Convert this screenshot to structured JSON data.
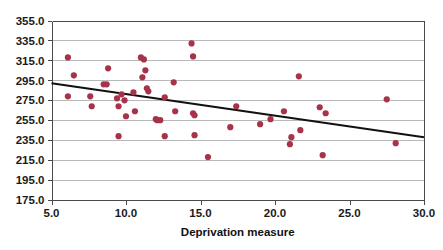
{
  "chart_data": {
    "type": "scatter",
    "title": "",
    "xlabel": "Deprivation measure",
    "ylabel": "",
    "xlim": [
      5.0,
      30.0
    ],
    "ylim": [
      175.0,
      355.0
    ],
    "grid": true,
    "legend": null,
    "xticks": [
      "5.0",
      "10.0",
      "15.0",
      "20.0",
      "25.0",
      "30.0"
    ],
    "xtick_values": [
      5.0,
      10.0,
      15.0,
      20.0,
      25.0,
      30.0
    ],
    "yticks": [
      "175.0",
      "195.0",
      "215.0",
      "235.0",
      "255.0",
      "275.0",
      "295.0",
      "315.0",
      "335.0",
      "355.0"
    ],
    "ytick_values": [
      175.0,
      195.0,
      215.0,
      235.0,
      255.0,
      275.0,
      295.0,
      315.0,
      335.0,
      355.0
    ],
    "point_color": "#a6334a",
    "point_radius": 3.1,
    "line_color": "#111111",
    "grid_color": "#b9b9b9",
    "frame_color": "#4a4a4a",
    "series": [
      {
        "name": "observations",
        "points": [
          [
            6.1,
            318.0
          ],
          [
            6.1,
            279.0
          ],
          [
            6.5,
            300.0
          ],
          [
            7.6,
            279.0
          ],
          [
            7.7,
            269.0
          ],
          [
            8.5,
            291.0
          ],
          [
            8.7,
            291.0
          ],
          [
            8.8,
            307.0
          ],
          [
            9.4,
            277.0
          ],
          [
            9.5,
            269.0
          ],
          [
            9.5,
            239.0
          ],
          [
            9.7,
            281.0
          ],
          [
            9.9,
            275.0
          ],
          [
            10.0,
            259.0
          ],
          [
            10.5,
            283.0
          ],
          [
            10.6,
            264.0
          ],
          [
            11.0,
            318.0
          ],
          [
            11.1,
            298.0
          ],
          [
            11.2,
            316.0
          ],
          [
            11.3,
            305.0
          ],
          [
            11.4,
            287.0
          ],
          [
            11.5,
            284.0
          ],
          [
            12.0,
            256.0
          ],
          [
            12.1,
            255.0
          ],
          [
            12.3,
            255.0
          ],
          [
            12.6,
            278.0
          ],
          [
            12.6,
            239.0
          ],
          [
            13.2,
            293.0
          ],
          [
            13.3,
            264.0
          ],
          [
            14.4,
            332.0
          ],
          [
            14.5,
            319.0
          ],
          [
            14.5,
            262.0
          ],
          [
            14.6,
            260.0
          ],
          [
            14.6,
            240.0
          ],
          [
            15.5,
            218.0
          ],
          [
            17.0,
            248.0
          ],
          [
            17.4,
            269.0
          ],
          [
            19.0,
            251.0
          ],
          [
            19.7,
            256.0
          ],
          [
            20.6,
            264.0
          ],
          [
            21.0,
            231.0
          ],
          [
            21.1,
            238.0
          ],
          [
            21.6,
            299.0
          ],
          [
            21.7,
            245.0
          ],
          [
            23.0,
            268.0
          ],
          [
            23.2,
            220.0
          ],
          [
            23.4,
            262.0
          ],
          [
            27.5,
            276.0
          ],
          [
            28.1,
            232.0
          ]
        ]
      }
    ],
    "trend_line": {
      "name": "fitted-regression-line",
      "x_start": 5.0,
      "y_start": 292.0,
      "x_end": 30.0,
      "y_end": 238.0
    }
  }
}
